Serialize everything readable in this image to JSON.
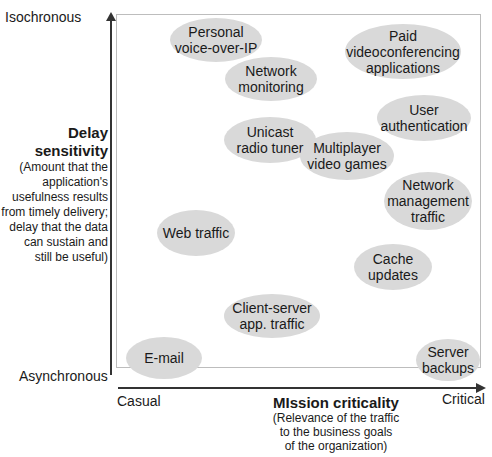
{
  "diagram": {
    "y_axis": {
      "top_label": "Isochronous",
      "bottom_label": "Asynchronous",
      "title": "Delay\nsensitivity",
      "description": "(Amount that the\napplication's\nusefulness results\nfrom timely delivery;\ndelay that the data\ncan sustain and\nstill be useful)"
    },
    "x_axis": {
      "left_label": "Casual",
      "right_label": "Critical",
      "title": "MIssion criticality",
      "description": "(Relevance of the traffic\nto the business goals\nof the organization)"
    },
    "bubbles": [
      {
        "label": "Personal\nvoice-over-IP"
      },
      {
        "label": "Paid\nvideoconferencing\napplications"
      },
      {
        "label": "Network\nmonitoring"
      },
      {
        "label": "User\nauthentication"
      },
      {
        "label": "Unicast\nradio tuner"
      },
      {
        "label": "Multiplayer\nvideo games"
      },
      {
        "label": "Network\nmanagement\ntraffic"
      },
      {
        "label": "Web traffic"
      },
      {
        "label": "Cache\nupdates"
      },
      {
        "label": "Client-server\napp. traffic"
      },
      {
        "label": "E-mail"
      },
      {
        "label": "Server\nbackups"
      }
    ],
    "colors": {
      "bubble_fill": "#d9d9d9",
      "axis": "#333333",
      "frame": "#bdbdbd"
    }
  }
}
